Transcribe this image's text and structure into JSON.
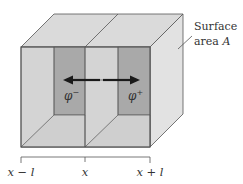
{
  "diagram": {
    "annotation": {
      "line1": "Surface",
      "line2": "area ",
      "symbol": "A"
    },
    "regions": [
      {
        "label": "φ",
        "superscript": "−"
      },
      {
        "label": "φ",
        "superscript": "+"
      }
    ],
    "axis": {
      "ticks": [
        {
          "label": "x − l"
        },
        {
          "label": "x"
        },
        {
          "label": "x + l"
        }
      ]
    },
    "arrow": {
      "direction": "bidirectional"
    },
    "colors": {
      "face_light": "#d4d4d4",
      "face_top": "#dadada",
      "face_side": "#e2e2e2",
      "face_inner": "#a9a9a9",
      "floor": "#cfcfcf",
      "edge": "#555555",
      "arrow": "#1a1a1a"
    }
  }
}
